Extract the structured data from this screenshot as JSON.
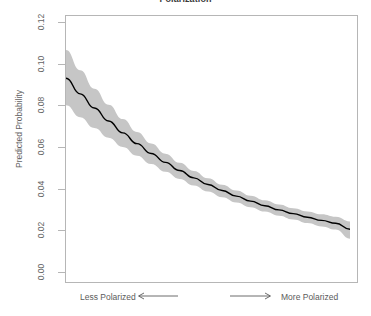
{
  "chart_data": {
    "type": "line",
    "title": "Polarization",
    "xlabel": "",
    "ylabel": "Predicted Probability",
    "ylim": [
      0.0,
      0.12
    ],
    "xlim": [
      0,
      100
    ],
    "grid": false,
    "legend": null,
    "ytick_labels": [
      "0.12",
      "0.10",
      "0.08",
      "0.06",
      "0.04",
      "0.02",
      "0.00"
    ],
    "ytick_values": [
      0.12,
      0.1,
      0.08,
      0.06,
      0.04,
      0.02,
      0.0
    ],
    "xtick_labels": [],
    "annotations": {
      "left_note": "Less Polarized",
      "right_note": "More Polarized",
      "left_arrow": "arrow-left",
      "right_arrow": "arrow-right"
    },
    "series": [
      {
        "name": "Predicted Probability",
        "style": "line",
        "color": "#000000",
        "x": [
          0,
          5,
          10,
          15,
          20,
          25,
          30,
          35,
          40,
          45,
          50,
          55,
          60,
          65,
          70,
          75,
          80,
          85,
          90,
          95,
          100
        ],
        "values": [
          0.093,
          0.0855,
          0.0787,
          0.0725,
          0.0668,
          0.0616,
          0.0569,
          0.0526,
          0.0487,
          0.0452,
          0.042,
          0.0391,
          0.0364,
          0.034,
          0.0318,
          0.0298,
          0.028,
          0.0263,
          0.0248,
          0.0234,
          0.0205
        ]
      },
      {
        "name": "95% Confidence Band",
        "style": "ribbon",
        "color": "#c6c6c6",
        "x": [
          0,
          5,
          10,
          15,
          20,
          25,
          30,
          35,
          40,
          45,
          50,
          55,
          60,
          65,
          70,
          75,
          80,
          85,
          90,
          95,
          100
        ],
        "upper": [
          0.1065,
          0.0968,
          0.088,
          0.0803,
          0.0734,
          0.0672,
          0.0617,
          0.0568,
          0.0524,
          0.0485,
          0.045,
          0.0419,
          0.0391,
          0.0366,
          0.0344,
          0.0324,
          0.0306,
          0.0291,
          0.0277,
          0.0265,
          0.0243
        ],
        "lower": [
          0.08,
          0.0743,
          0.0691,
          0.0644,
          0.06,
          0.0558,
          0.0518,
          0.0481,
          0.0447,
          0.0415,
          0.0386,
          0.0359,
          0.0334,
          0.0311,
          0.029,
          0.027,
          0.0252,
          0.0235,
          0.0219,
          0.0204,
          0.016
        ]
      }
    ]
  },
  "colors": {
    "line": "#000000",
    "ribbon": "#c6c6c6",
    "frame": "#b6b6b6",
    "text": "#636363",
    "title": "#3a3a3a",
    "background": "#ffffff"
  }
}
